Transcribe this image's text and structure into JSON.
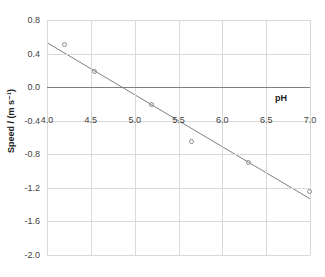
{
  "chart_data": {
    "type": "scatter",
    "title": "",
    "xlabel": "pH",
    "ylabel": "Speed / (m s⁻¹)",
    "xlim": [
      4.0,
      7.0
    ],
    "ylim": [
      -2.0,
      0.8
    ],
    "xticks": [
      "4.0",
      "4.5",
      "5.0",
      "5.5",
      "6.0",
      "6.5",
      "7.0"
    ],
    "xtick_values": [
      4.0,
      4.5,
      5.0,
      5.5,
      6.0,
      6.5,
      7.0
    ],
    "yticks": [
      "0.8",
      "0.4",
      "0.0",
      "-0.4",
      "-0.8",
      "-1.2",
      "-1.6",
      "-2.0"
    ],
    "ytick_values": [
      0.8,
      0.4,
      0.0,
      -0.4,
      -0.8,
      -1.2,
      -1.6,
      -2.0
    ],
    "grid": true,
    "legend": "none",
    "marker_style": "open-circle",
    "series": [
      {
        "name": "Speed vs pH",
        "x": [
          4.2,
          4.55,
          5.2,
          5.65,
          6.3,
          7.0
        ],
        "y": [
          0.5,
          0.18,
          -0.21,
          -0.65,
          -0.9,
          -1.25
        ]
      }
    ],
    "trendline": {
      "type": "linear",
      "x_start": 4.0,
      "y_start": 0.53,
      "x_end": 7.0,
      "y_end": -1.33
    },
    "colors": {
      "gridline": "#d9d9d9",
      "axis": "#7f7f7f",
      "zero_line": "#7f7f7f",
      "marker_stroke": "#8c8c8c",
      "trendline": "#808080",
      "tick_label": "#3f3f3f",
      "axis_title": "#1a1a1a",
      "background": "#ffffff"
    }
  }
}
